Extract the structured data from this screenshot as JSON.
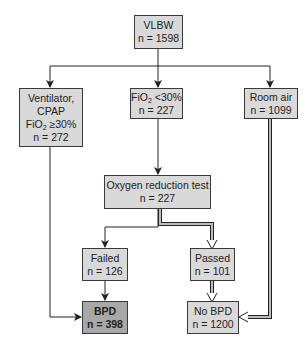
{
  "diagram": {
    "type": "flowchart",
    "colors": {
      "box_fill": "#d9d9d9",
      "outcome_bpd_fill": "#a8a8a8",
      "line": "#222222",
      "double_line_fill": "#bdbdbd"
    },
    "nodes": {
      "vlbw": {
        "label": "VLBW",
        "n": "n = 1598"
      },
      "ventilator": {
        "line1": "Ventilator,",
        "line2": "CPAP",
        "line3_prefix": "FiO",
        "line3_sub": "2",
        "line3_suffix": " ≥30%",
        "n": "n = 272"
      },
      "fio2_low": {
        "prefix": "FiO",
        "sub": "2",
        "suffix": " <30%",
        "n": "n = 227"
      },
      "room_air": {
        "label": "Room air",
        "n": "n = 1099"
      },
      "oxygen_test": {
        "label": "Oxygen reduction test",
        "n": "n = 227"
      },
      "failed": {
        "label": "Failed",
        "n": "n = 126"
      },
      "passed": {
        "label": "Passed",
        "n": "n = 101"
      },
      "bpd": {
        "label": "BPD",
        "n": "n = 398"
      },
      "no_bpd": {
        "label": "No BPD",
        "n": "n = 1200"
      }
    },
    "edges": [
      {
        "from": "vlbw",
        "to": "ventilator",
        "style": "single"
      },
      {
        "from": "vlbw",
        "to": "fio2_low",
        "style": "single"
      },
      {
        "from": "vlbw",
        "to": "room_air",
        "style": "single"
      },
      {
        "from": "fio2_low",
        "to": "oxygen_test",
        "style": "single"
      },
      {
        "from": "oxygen_test",
        "to": "failed",
        "style": "single"
      },
      {
        "from": "oxygen_test",
        "to": "passed",
        "style": "double"
      },
      {
        "from": "failed",
        "to": "bpd",
        "style": "single"
      },
      {
        "from": "passed",
        "to": "no_bpd",
        "style": "double"
      },
      {
        "from": "ventilator",
        "to": "bpd",
        "style": "single"
      },
      {
        "from": "room_air",
        "to": "no_bpd",
        "style": "double"
      }
    ]
  }
}
